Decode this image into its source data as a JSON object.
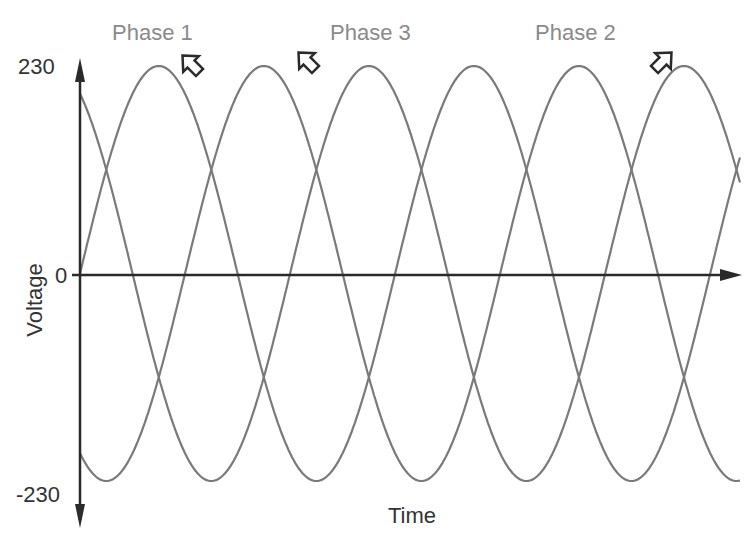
{
  "chart_data": {
    "type": "line",
    "title": "",
    "xlabel": "Time",
    "ylabel": "Voltage",
    "x_unit": "electrical degrees (not labeled)",
    "xlim": [
      0,
      754
    ],
    "ylim": [
      -230,
      230
    ],
    "y_ticks": [
      {
        "value": 230,
        "label": "230"
      },
      {
        "value": 0,
        "label": "0"
      },
      {
        "value": -230,
        "label": "-230"
      }
    ],
    "grid": false,
    "amplitude": 230,
    "series": [
      {
        "name": "Phase 1",
        "amplitude": 230,
        "phase_shift_deg": 0,
        "period_deg": 360,
        "color": "#7a7a7a",
        "pointer": "down-left toward first peak"
      },
      {
        "name": "Phase 3",
        "amplitude": 230,
        "phase_shift_deg": -120,
        "period_deg": 360,
        "color": "#7a7a7a",
        "pointer": "down-left toward second peak"
      },
      {
        "name": "Phase 2",
        "amplitude": 230,
        "phase_shift_deg": -240,
        "period_deg": 360,
        "color": "#7a7a7a",
        "pointer": "down-right toward last peak"
      }
    ],
    "legend": [
      {
        "label": "Phase 1",
        "position": "top-left"
      },
      {
        "label": "Phase 3",
        "position": "top-center"
      },
      {
        "label": "Phase 2",
        "position": "top-right"
      }
    ]
  }
}
